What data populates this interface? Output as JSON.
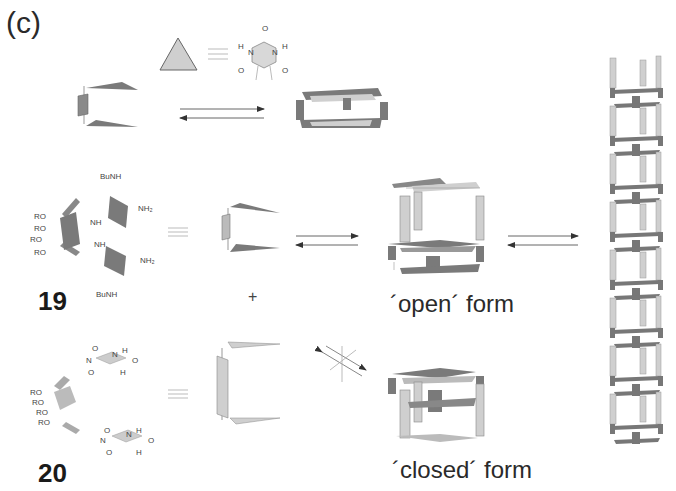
{
  "panel_label": "(c)",
  "legend_row": {
    "symbol": "triangle",
    "equivalent_to": "barbiturate",
    "atoms": [
      "O",
      "H",
      "N",
      "N",
      "H",
      "O",
      "O"
    ]
  },
  "compounds": [
    {
      "id": "19",
      "substituents": [
        "BuNH",
        "NH",
        "NH2",
        "RO",
        "RO",
        "RO",
        "RO",
        "NH",
        "NH2",
        "BuNH"
      ],
      "labels": {
        "bunh_top": "BuNH",
        "nh2_top": "NH₂",
        "nh_top": "NH",
        "nh_bot": "NH",
        "nh2_bot": "NH₂",
        "bunh_bot": "BuNH",
        "ro": "RO"
      }
    },
    {
      "id": "20",
      "labels": {
        "o": "O",
        "n": "N",
        "h": "H",
        "ro": "RO"
      }
    }
  ],
  "operators": {
    "plus": "+"
  },
  "forms": {
    "open": "´open´ form",
    "closed": "´closed´ form"
  },
  "colors": {
    "dark_fill": "#7a7a7a",
    "light_fill": "#cfcfcf",
    "line": "#555555",
    "text": "#2a2a2a"
  }
}
